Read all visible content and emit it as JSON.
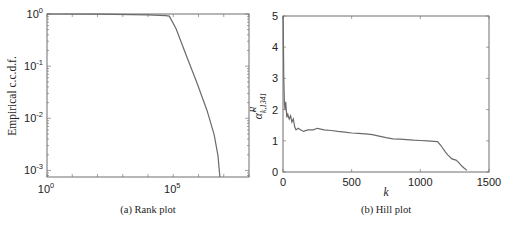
{
  "chart_data": [
    {
      "type": "line",
      "title": "",
      "caption": "(a) Rank plot",
      "xlabel": "",
      "ylabel": "Empirical c.c.d.f.",
      "xscale": "log",
      "yscale": "log",
      "xlim": [
        1,
        100000000
      ],
      "ylim": [
        0.00075,
        1
      ],
      "xticks": [
        {
          "base": "10",
          "exp": "0",
          "value": 1
        },
        {
          "base": "10",
          "exp": "5",
          "value": 100000
        }
      ],
      "yticks": [
        {
          "base": "10",
          "exp": "0",
          "value": 1
        },
        {
          "base": "10",
          "exp": "-1",
          "value": 0.1
        },
        {
          "base": "10",
          "exp": "-2",
          "value": 0.01
        },
        {
          "base": "10",
          "exp": "-3",
          "value": 0.001
        }
      ],
      "grid": false,
      "series": [
        {
          "name": "ccdf",
          "x": [
            1,
            100,
            10000,
            50000,
            70000,
            130000,
            330000,
            880000,
            2200000,
            4200000,
            5900000,
            6800000,
            7100000
          ],
          "y": [
            1,
            0.99,
            0.96,
            0.93,
            0.91,
            0.52,
            0.16,
            0.047,
            0.014,
            0.0048,
            0.0019,
            0.0009,
            0.00075
          ]
        }
      ]
    },
    {
      "type": "line",
      "title": "",
      "caption": "(b) Hill plot",
      "xlabel": "k",
      "ylabel": "α̂^H_{k,1341}",
      "ylabel_parts": {
        "base": "α̂",
        "sup": "H",
        "sub": "k,1341"
      },
      "xlim": [
        0,
        1500
      ],
      "ylim": [
        0,
        5
      ],
      "xticks": [
        "0",
        "500",
        "1000",
        "1500"
      ],
      "yticks": [
        "0",
        "1",
        "2",
        "3",
        "4",
        "5"
      ],
      "grid": false,
      "series": [
        {
          "name": "hill",
          "x": [
            1,
            3,
            6,
            10,
            15,
            20,
            28,
            35,
            45,
            55,
            65,
            75,
            85,
            95,
            110,
            130,
            150,
            180,
            220,
            250,
            300,
            350,
            400,
            450,
            500,
            550,
            600,
            650,
            700,
            750,
            800,
            850,
            900,
            950,
            1000,
            1050,
            1100,
            1125,
            1150,
            1180,
            1200,
            1230,
            1260,
            1280,
            1300,
            1320,
            1340
          ],
          "y": [
            5.0,
            4.2,
            3.0,
            2.2,
            2.0,
            2.25,
            1.75,
            1.85,
            1.7,
            1.8,
            1.6,
            1.7,
            1.45,
            1.35,
            1.4,
            1.35,
            1.3,
            1.35,
            1.35,
            1.4,
            1.35,
            1.33,
            1.3,
            1.28,
            1.25,
            1.24,
            1.22,
            1.2,
            1.15,
            1.1,
            1.06,
            1.05,
            1.04,
            1.02,
            1.01,
            1.0,
            0.98,
            0.97,
            0.85,
            0.65,
            0.55,
            0.42,
            0.38,
            0.3,
            0.2,
            0.12,
            0.05
          ]
        }
      ]
    }
  ]
}
